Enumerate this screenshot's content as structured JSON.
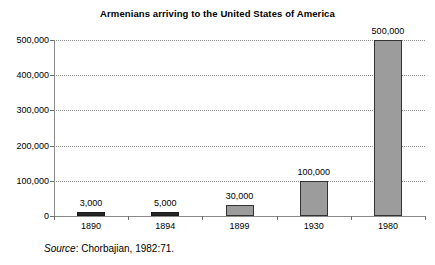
{
  "chart_data": {
    "type": "bar",
    "title": "Armenians arriving to the United States of America",
    "xlabel": "",
    "ylabel": "",
    "categories": [
      "1890",
      "1894",
      "1899",
      "1930",
      "1980"
    ],
    "values": [
      3000,
      5000,
      30000,
      100000,
      500000
    ],
    "value_labels": [
      "3,000",
      "5,000",
      "30,000",
      "100,000",
      "500,000"
    ],
    "ylim": [
      0,
      500000
    ],
    "yticks": [
      0,
      100000,
      200000,
      300000,
      400000,
      500000
    ],
    "ytick_labels": [
      "0",
      "100,000",
      "200,000",
      "300,000",
      "400,000",
      "500,000"
    ],
    "grid": true,
    "legend": "none",
    "bar_fill_color": "#9c9c9c",
    "bar_border_color": "#333333",
    "gridline_color": "#8c8c8c",
    "axis_color": "#8a8a8a"
  },
  "source": {
    "label": "Source",
    "separator": ": ",
    "text": "Chorbajian, 1982:71."
  }
}
